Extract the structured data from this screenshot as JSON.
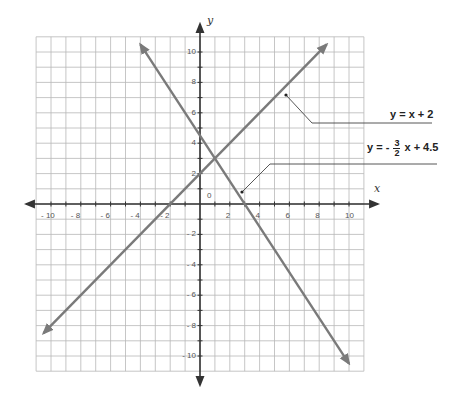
{
  "chart_data": {
    "type": "line",
    "title": "",
    "xlabel": "x",
    "ylabel": "y",
    "xlim": [
      -11,
      11
    ],
    "ylim": [
      -11,
      11
    ],
    "grid": true,
    "origin_label": "0",
    "x_ticks": [
      -10,
      -8,
      -6,
      -4,
      -2,
      2,
      4,
      6,
      8,
      10
    ],
    "y_ticks": [
      10,
      8,
      6,
      4,
      2,
      -2,
      -4,
      -6,
      -8,
      -10
    ],
    "x_tick_labels": [
      "- 10",
      "- 8",
      "- 6",
      "- 4",
      "- 2",
      "2",
      "4",
      "6",
      "8",
      "10"
    ],
    "y_tick_labels": [
      "10",
      "8",
      "6",
      "4",
      "2",
      "- 2",
      "- 4",
      "- 6",
      "- 8",
      "- 10"
    ],
    "series": [
      {
        "name": "y = x + 2",
        "slope": 1,
        "intercept": 2,
        "x": [
          -10.5,
          5.5,
          8.5
        ],
        "y": [
          -8.5,
          7.5,
          10.5
        ],
        "color": "#7a7a7a"
      },
      {
        "name": "y = -3/2 x + 4.5",
        "slope": -1.5,
        "intercept": 4.5,
        "x": [
          -4,
          2.5,
          10
        ],
        "y": [
          10.5,
          0.75,
          -10.5
        ],
        "color": "#7a7a7a"
      }
    ],
    "intersection": {
      "x": 1,
      "y": 3
    },
    "annotations": [
      {
        "text": "y = x + 2",
        "points_to": {
          "x": 5.7,
          "y": 7.1
        }
      },
      {
        "text": "y = - 3/2 x + 4.5",
        "points_to": {
          "x": 2.8,
          "y": 0.8
        }
      }
    ]
  },
  "labels": {
    "x_axis": "x",
    "y_axis": "y",
    "origin": "0",
    "eq1": "y = x + 2",
    "eq2_prefix": "y = -",
    "eq2_num": "3",
    "eq2_den": "2",
    "eq2_suffix": "x + 4.5"
  },
  "colors": {
    "grid": "#b8b8b8",
    "axis": "#333333",
    "line": "#7a7a7a",
    "leader": "#444444"
  }
}
